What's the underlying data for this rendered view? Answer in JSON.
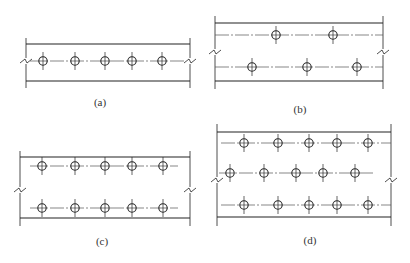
{
  "figure": {
    "line_color": "#222222",
    "centerline_color": "#555555",
    "panels": [
      {
        "id": "a",
        "label": "(a)",
        "label_pos": [
          100,
          96
        ],
        "left": 26,
        "right": 190,
        "top": 44,
        "bottom": 81,
        "vtop": 38,
        "vbot": 88,
        "rows": [
          {
            "y": 61,
            "x1": 30,
            "x2": 186,
            "holes": [
              43,
              75,
              105,
              132,
              162
            ]
          }
        ],
        "zig_y": 61
      },
      {
        "id": "b",
        "label": "(b)",
        "label_pos": [
          300,
          103
        ],
        "left": 215,
        "right": 383,
        "top": 23,
        "bottom": 81,
        "vtop": 16,
        "vbot": 89,
        "rows": [
          {
            "y": 35,
            "x1": 215,
            "x2": 383,
            "holes": [
              276,
              333
            ]
          },
          {
            "y": 67,
            "x1": 215,
            "x2": 383,
            "holes": [
              252,
              307,
              357
            ]
          }
        ],
        "zig_y": 52
      },
      {
        "id": "c",
        "label": "(c)",
        "label_pos": [
          102,
          235
        ],
        "left": 20,
        "right": 190,
        "top": 157,
        "bottom": 218,
        "vtop": 151,
        "vbot": 226,
        "rows": [
          {
            "y": 166,
            "x1": 30,
            "x2": 178,
            "holes": [
              42,
              75,
              105,
              132,
              163
            ]
          },
          {
            "y": 208,
            "x1": 30,
            "x2": 178,
            "holes": [
              42,
              75,
              105,
              132,
              163
            ]
          }
        ],
        "zig_y": 190
      },
      {
        "id": "d",
        "label": "(d)",
        "label_pos": [
          310,
          234
        ],
        "left": 217,
        "right": 391,
        "top": 132,
        "bottom": 217,
        "vtop": 124,
        "vbot": 226,
        "rows": [
          {
            "y": 143,
            "x1": 221,
            "x2": 391,
            "holes": [
              244,
              278,
              309,
              337,
              368
            ]
          },
          {
            "y": 173,
            "x1": 219,
            "x2": 374,
            "holes": [
              230,
              264,
              296,
              323,
              355
            ]
          },
          {
            "y": 205,
            "x1": 221,
            "x2": 391,
            "holes": [
              244,
              278,
              309,
              337,
              368
            ]
          }
        ],
        "zig_y": 180
      }
    ]
  }
}
